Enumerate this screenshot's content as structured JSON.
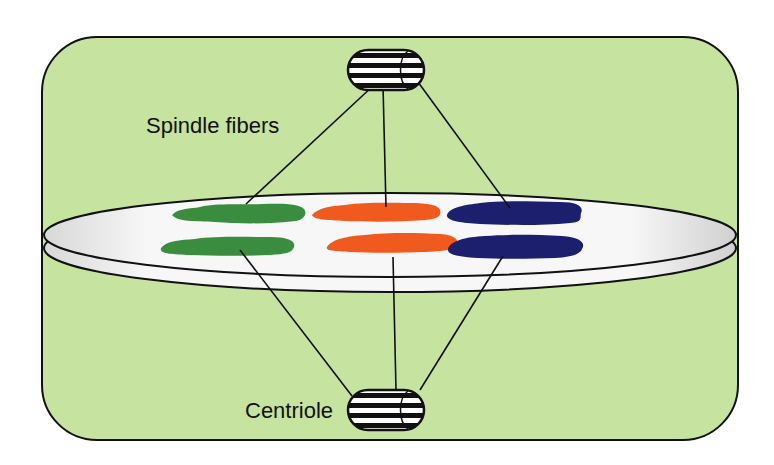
{
  "diagram": {
    "labels": {
      "spindle_fibers": "Spindle fibers",
      "centriole": "Centriole"
    },
    "colors": {
      "cell_background": "#c6e3a0",
      "outline": "#111111",
      "plate_fill": "#f2f2f2",
      "chromosome_green": "#3a8c3f",
      "chromosome_orange": "#f05a1e",
      "chromosome_blue": "#1c1f6e"
    },
    "chromosomes": {
      "top_row": [
        "green",
        "orange",
        "blue"
      ],
      "bottom_row": [
        "green",
        "orange",
        "blue"
      ]
    }
  }
}
